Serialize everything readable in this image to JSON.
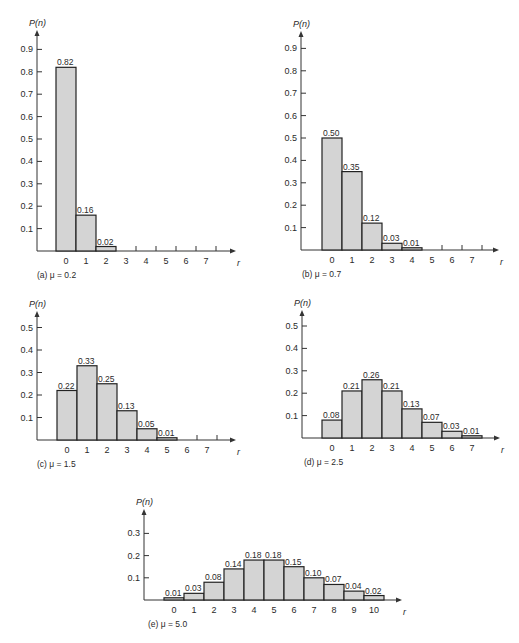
{
  "figure": {
    "bar_fill": "#d4d4d4",
    "bar_stroke": "#222222",
    "axis_color": "#333333"
  },
  "chart_data": [
    {
      "id": "a",
      "type": "bar",
      "caption": "(a) μ = 0.2",
      "ylabel": "P(n)",
      "xlabel": "r",
      "categories": [
        "0",
        "1",
        "2",
        "3",
        "4",
        "5",
        "6",
        "7"
      ],
      "values": [
        0.82,
        0.16,
        0.02,
        null,
        null,
        null,
        null,
        null
      ],
      "labels": [
        "0.82",
        "0.16",
        "0.02"
      ],
      "yticks": [
        "0.1",
        "0.2",
        "0.3",
        "0.4",
        "0.5",
        "0.6",
        "0.7",
        "0.8",
        "0.9"
      ],
      "ylim": [
        0,
        0.95
      ]
    },
    {
      "id": "b",
      "type": "bar",
      "caption": "(b) μ = 0.7",
      "ylabel": "P(n)",
      "xlabel": "r",
      "categories": [
        "0",
        "1",
        "2",
        "3",
        "4",
        "5",
        "6",
        "7"
      ],
      "values": [
        0.5,
        0.35,
        0.12,
        0.03,
        0.01,
        null,
        null,
        null
      ],
      "labels": [
        "0.50",
        "0.35",
        "0.12",
        "0.03",
        "0.01"
      ],
      "yticks": [
        "0.1",
        "0.2",
        "0.3",
        "0.4",
        "0.5",
        "0.6",
        "0.7",
        "0.8",
        "0.9"
      ],
      "ylim": [
        0,
        0.95
      ]
    },
    {
      "id": "c",
      "type": "bar",
      "caption": "(c) μ = 1.5",
      "ylabel": "P(n)",
      "xlabel": "r",
      "categories": [
        "0",
        "1",
        "2",
        "3",
        "4",
        "5",
        "6",
        "7"
      ],
      "values": [
        0.22,
        0.33,
        0.25,
        0.13,
        0.05,
        0.01,
        null,
        null
      ],
      "labels": [
        "0.22",
        "0.33",
        "0.25",
        "0.13",
        "0.05",
        "0.01"
      ],
      "yticks": [
        "0.1",
        "0.2",
        "0.3",
        "0.4",
        "0.5"
      ],
      "ylim": [
        0,
        0.55
      ]
    },
    {
      "id": "d",
      "type": "bar",
      "caption": "(d) μ = 2.5",
      "ylabel": "P(n)",
      "xlabel": "r",
      "categories": [
        "0",
        "1",
        "2",
        "3",
        "4",
        "5",
        "6",
        "7"
      ],
      "values": [
        0.08,
        0.21,
        0.26,
        0.21,
        0.13,
        0.07,
        0.03,
        0.01
      ],
      "labels": [
        "0.08",
        "0.21",
        "0.26",
        "0.21",
        "0.13",
        "0.07",
        "0.03",
        "0.01"
      ],
      "yticks": [
        "0.1",
        "0.2",
        "0.3",
        "0.4",
        "0.5"
      ],
      "ylim": [
        0,
        0.55
      ]
    },
    {
      "id": "e",
      "type": "bar",
      "caption": "(e) μ = 5.0",
      "ylabel": "P(n)",
      "xlabel": "r",
      "categories": [
        "0",
        "1",
        "2",
        "3",
        "4",
        "5",
        "6",
        "7",
        "8",
        "9",
        "10"
      ],
      "values": [
        0.01,
        0.03,
        0.08,
        0.14,
        0.18,
        0.18,
        0.15,
        0.1,
        0.07,
        0.04,
        0.02
      ],
      "labels": [
        "0.01",
        "0.03",
        "0.08",
        "0.14",
        "0.18",
        "0.18",
        "0.15",
        "0.10",
        "0.07",
        "0.04",
        "0.02"
      ],
      "yticks": [
        "0.1",
        "0.2",
        "0.3"
      ],
      "ylim": [
        0,
        0.35
      ]
    }
  ]
}
